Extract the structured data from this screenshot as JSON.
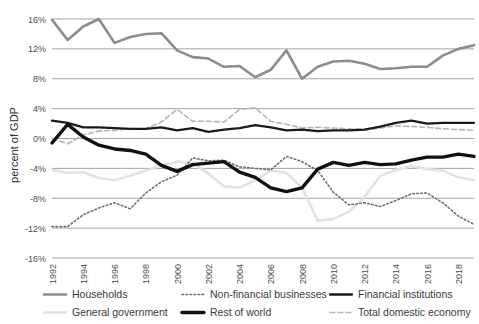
{
  "chart_data": {
    "type": "line",
    "title": "",
    "xlabel": "",
    "ylabel": "percent of GDP",
    "ylim": [
      -16,
      16
    ],
    "ytick_step": 4,
    "grid": true,
    "legend_position": "bottom",
    "x": [
      1992,
      1993,
      1994,
      1995,
      1996,
      1997,
      1998,
      1999,
      2000,
      2001,
      2002,
      2003,
      2004,
      2005,
      2006,
      2007,
      2008,
      2009,
      2010,
      2011,
      2012,
      2013,
      2014,
      2015,
      2016,
      2017,
      2018,
      2019
    ],
    "xtick_labels": [
      "1992",
      "1994",
      "1996",
      "1998",
      "2000",
      "2002",
      "2004",
      "2006",
      "2008",
      "2010",
      "2012",
      "2014",
      "2016",
      "2018"
    ],
    "ytick_labels": [
      "16%",
      "12%",
      "8%",
      "4%",
      "0%",
      "-4%",
      "-8%",
      "-12%",
      "-16%"
    ],
    "ytick_values": [
      16,
      12,
      8,
      4,
      0,
      -4,
      -8,
      -12,
      -16
    ],
    "series": [
      {
        "name": "Households",
        "style": "solid",
        "color": "#8c8c8c",
        "width": 2.6,
        "values": [
          15.9,
          13.2,
          15.0,
          16.0,
          12.8,
          13.6,
          14.0,
          14.1,
          11.8,
          10.9,
          10.7,
          9.6,
          9.7,
          8.2,
          9.2,
          11.8,
          8.0,
          9.6,
          10.3,
          10.4,
          10.0,
          9.3,
          9.4,
          9.6,
          9.6,
          11.1,
          12.0,
          12.5
        ]
      },
      {
        "name": "General government",
        "style": "solid",
        "color": "#e2e2e2",
        "width": 2.6,
        "values": [
          -4.2,
          -4.6,
          -4.5,
          -5.3,
          -5.6,
          -5.0,
          -4.3,
          -3.6,
          -3.1,
          -3.3,
          -4.7,
          -6.4,
          -6.6,
          -5.6,
          -4.3,
          -4.6,
          -6.6,
          -11.0,
          -10.8,
          -9.8,
          -7.8,
          -5.0,
          -4.2,
          -3.7,
          -4.1,
          -4.3,
          -5.2,
          -5.6
        ]
      },
      {
        "name": "Non-financial businesses",
        "style": "dotted",
        "color": "#6e6e6e",
        "width": 1.6,
        "values": [
          -11.8,
          -11.8,
          -10.2,
          -9.3,
          -8.6,
          -9.4,
          -7.3,
          -5.8,
          -4.9,
          -2.6,
          -3.0,
          -2.9,
          -3.8,
          -4.0,
          -4.2,
          -2.4,
          -3.1,
          -4.3,
          -7.2,
          -8.9,
          -8.6,
          -9.1,
          -8.3,
          -7.4,
          -7.3,
          -8.6,
          -10.4,
          -11.5
        ]
      },
      {
        "name": "Rest of world",
        "style": "solid",
        "color": "#111111",
        "width": 3.4,
        "values": [
          -0.6,
          1.9,
          0.2,
          -0.9,
          -1.4,
          -1.6,
          -2.1,
          -3.6,
          -4.4,
          -3.5,
          -3.3,
          -3.1,
          -4.5,
          -5.2,
          -6.6,
          -7.1,
          -6.6,
          -4.1,
          -3.2,
          -3.6,
          -3.2,
          -3.5,
          -3.4,
          -2.9,
          -2.5,
          -2.5,
          -2.1,
          -2.4
        ]
      },
      {
        "name": "Financial institutions",
        "style": "solid",
        "color": "#1a1a1a",
        "width": 2.3,
        "values": [
          2.4,
          2.1,
          1.5,
          1.5,
          1.4,
          1.3,
          1.3,
          1.5,
          1.1,
          1.4,
          0.9,
          1.2,
          1.4,
          1.8,
          1.5,
          1.1,
          1.2,
          1.0,
          1.1,
          1.1,
          1.2,
          1.6,
          2.1,
          2.4,
          2.0,
          2.1,
          2.1,
          2.1
        ]
      },
      {
        "name": "Total domestic economy",
        "style": "dashed",
        "color": "#b4b4b4",
        "width": 1.6,
        "values": [
          0.0,
          -0.7,
          0.5,
          1.0,
          1.1,
          1.3,
          1.3,
          2.2,
          3.9,
          2.3,
          2.3,
          2.2,
          3.9,
          4.1,
          2.3,
          1.9,
          1.4,
          1.5,
          1.4,
          1.3,
          1.2,
          1.4,
          1.7,
          1.6,
          1.5,
          1.3,
          1.2,
          1.1
        ]
      }
    ]
  },
  "axis": {
    "ylabel": "percent of GDP"
  },
  "legend": {
    "items": [
      {
        "label": "Households",
        "marker": "solid-line-icon"
      },
      {
        "label": "Non-financial businesses",
        "marker": "dotted-line-icon"
      },
      {
        "label": "Financial institutions",
        "marker": "solid-line-icon"
      },
      {
        "label": "General government",
        "marker": "solid-line-icon"
      },
      {
        "label": "Rest of world",
        "marker": "thick-solid-line-icon"
      },
      {
        "label": "Total domestic economy",
        "marker": "dashed-line-icon"
      }
    ]
  }
}
